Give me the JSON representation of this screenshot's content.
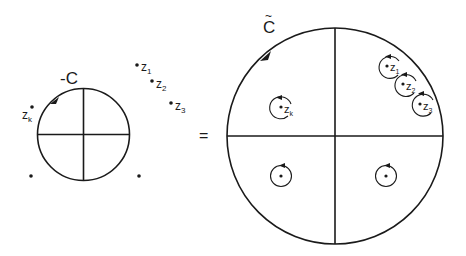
{
  "diagram": {
    "left": {
      "contour_label": "-C",
      "circle": {
        "cx": 83.5,
        "cy": 134.5,
        "r": 46
      },
      "points": [
        {
          "name": "z1",
          "label": "z",
          "sub": "1",
          "x": 137,
          "y": 65
        },
        {
          "name": "z2",
          "label": "z",
          "sub": "2",
          "x": 152,
          "y": 81
        },
        {
          "name": "z3",
          "label": "z",
          "sub": "3",
          "x": 171,
          "y": 103
        },
        {
          "name": "zk",
          "label": "z",
          "sub": "k",
          "x": 32,
          "y": 107
        },
        {
          "name": "p-bottom-left",
          "label": "",
          "sub": "",
          "x": 31,
          "y": 176
        },
        {
          "name": "p-bottom-right",
          "label": "",
          "sub": "",
          "x": 139,
          "y": 176
        }
      ]
    },
    "equals_sign": "=",
    "right": {
      "contour_label": "C",
      "contour_accent": "~",
      "circle": {
        "cx": 335,
        "cy": 136,
        "r": 108
      },
      "small_contours": [
        {
          "name": "z1",
          "label": "z",
          "sub": "1",
          "cx": 390,
          "cy": 67,
          "r": 11
        },
        {
          "name": "z2",
          "label": "z",
          "sub": "2",
          "cx": 406,
          "cy": 85,
          "r": 11
        },
        {
          "name": "z3",
          "label": "z",
          "sub": "3",
          "cx": 423,
          "cy": 104,
          "r": 11
        },
        {
          "name": "zk",
          "label": "z",
          "sub": "k",
          "cx": 281,
          "cy": 108,
          "r": 11
        },
        {
          "name": "bottom-left",
          "label": "",
          "sub": "",
          "cx": 281,
          "cy": 175,
          "r": 11
        },
        {
          "name": "bottom-right",
          "label": "",
          "sub": "",
          "cx": 386,
          "cy": 175,
          "r": 11
        }
      ]
    },
    "colors": {
      "ink": "#1a1a1a",
      "background": "#ffffff"
    }
  }
}
